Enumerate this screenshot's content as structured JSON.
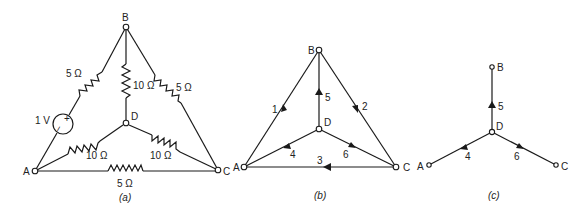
{
  "figure_a": {
    "caption": "(a)",
    "nodes": {
      "A": "A",
      "B": "B",
      "C": "C",
      "D": "D"
    },
    "resistors": {
      "AB": "5 Ω",
      "BD": "10 Ω",
      "BC": "5 Ω",
      "AD": "10 Ω",
      "DC": "10 Ω",
      "AC": "5 Ω"
    },
    "source": {
      "label": "1 V",
      "plus": "+",
      "minus": "−"
    }
  },
  "figure_b": {
    "caption": "(b)",
    "nodes": {
      "A": "A",
      "B": "B",
      "C": "C",
      "D": "D"
    },
    "branches": [
      "1",
      "2",
      "3",
      "4",
      "5",
      "6"
    ]
  },
  "figure_c": {
    "caption": "(c)",
    "nodes": {
      "A": "A",
      "B": "B",
      "C": "C",
      "D": "D"
    },
    "branches": {
      "b4": "4",
      "b5": "5",
      "b6": "6"
    }
  }
}
